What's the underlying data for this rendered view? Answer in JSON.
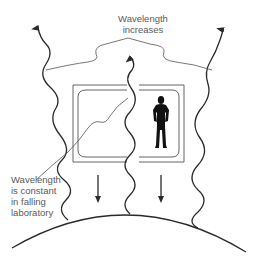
{
  "diagram": {
    "type": "physics-illustration",
    "labels": {
      "top": {
        "line1": "Wavelength",
        "line2": "increases"
      },
      "left": {
        "line1": "Wavelength",
        "line2": "is constant",
        "line3": "in falling",
        "line4": "laboratory"
      }
    },
    "elements": {
      "light_rays": 3,
      "falling_arrows": 2,
      "laboratory": "box with person inside",
      "ground": "curved planet surface"
    },
    "colors": {
      "line": "#2a2a2a",
      "leader_line": "#555555",
      "label_text": "#5a5a5a",
      "figure": "#111111",
      "background": "#ffffff"
    }
  }
}
